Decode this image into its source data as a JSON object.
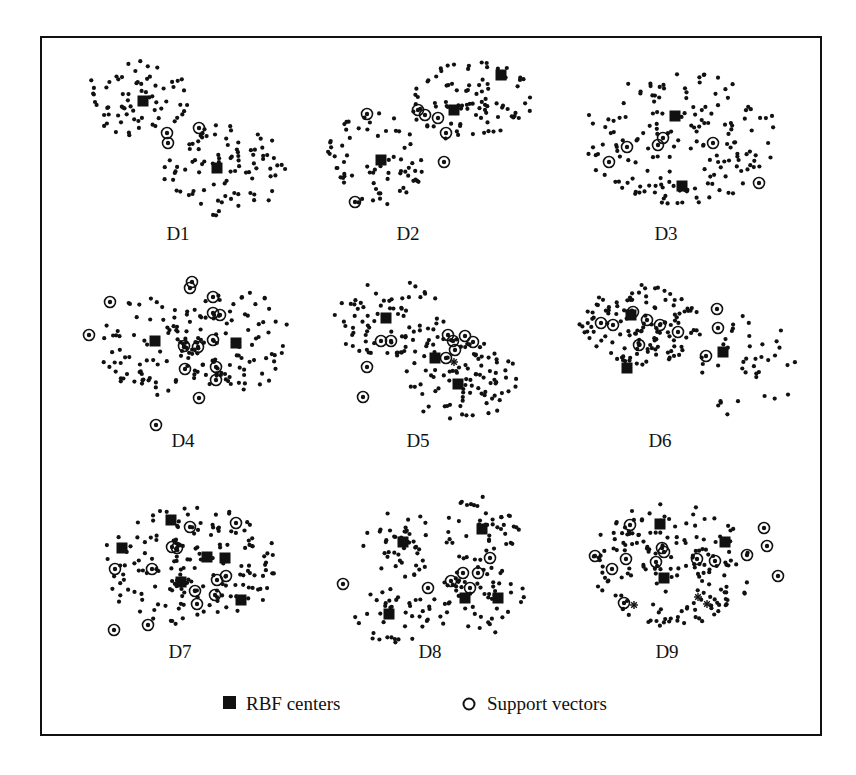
{
  "figure": {
    "frame": {
      "x": 41,
      "y": 37,
      "width": 780,
      "height": 698,
      "stroke": "#111111"
    },
    "legend": {
      "items": [
        {
          "symbol": "filled-square",
          "label": "RBF centers",
          "x": 223,
          "y": 705
        },
        {
          "symbol": "open-circle",
          "label": "Support vectors",
          "x": 462,
          "y": 705
        }
      ]
    }
  },
  "chart_data": [
    {
      "type": "scatter",
      "title": "D1",
      "label_pos": [
        178,
        240
      ],
      "clusters": [
        {
          "cx": 140,
          "cy": 98,
          "rx": 58,
          "ry": 38,
          "n": 70
        },
        {
          "cx": 225,
          "cy": 170,
          "rx": 62,
          "ry": 46,
          "n": 90
        }
      ],
      "rbf_centers": [
        [
          143,
          101
        ],
        [
          217,
          168
        ]
      ],
      "support_vectors": [
        [
          199,
          128
        ],
        [
          167,
          133
        ],
        [
          168,
          143
        ]
      ],
      "stars": [],
      "seed": 11
    },
    {
      "type": "scatter",
      "title": "D2",
      "label_pos": [
        408,
        240
      ],
      "clusters": [
        {
          "cx": 375,
          "cy": 160,
          "rx": 50,
          "ry": 48,
          "n": 70
        },
        {
          "cx": 470,
          "cy": 100,
          "rx": 62,
          "ry": 42,
          "n": 90
        }
      ],
      "rbf_centers": [
        [
          381,
          160
        ],
        [
          454,
          110
        ],
        [
          501,
          75
        ]
      ],
      "support_vectors": [
        [
          367,
          114
        ],
        [
          418,
          110
        ],
        [
          425,
          115
        ],
        [
          438,
          118
        ],
        [
          446,
          133
        ],
        [
          444,
          162
        ],
        [
          355,
          202
        ]
      ],
      "stars": [],
      "seed": 23
    },
    {
      "type": "scatter",
      "title": "D3",
      "label_pos": [
        666,
        240
      ],
      "clusters": [
        {
          "cx": 680,
          "cy": 138,
          "rx": 98,
          "ry": 66,
          "n": 170
        }
      ],
      "rbf_centers": [
        [
          675,
          116
        ],
        [
          682,
          186
        ]
      ],
      "support_vectors": [
        [
          627,
          147
        ],
        [
          609,
          162
        ],
        [
          658,
          145
        ],
        [
          663,
          138
        ],
        [
          713,
          143
        ],
        [
          759,
          183
        ]
      ],
      "stars": [],
      "seed": 37
    },
    {
      "type": "scatter",
      "title": "D4",
      "label_pos": [
        183,
        447
      ],
      "clusters": [
        {
          "cx": 158,
          "cy": 345,
          "rx": 58,
          "ry": 50,
          "n": 90
        },
        {
          "cx": 235,
          "cy": 340,
          "rx": 55,
          "ry": 52,
          "n": 80
        }
      ],
      "rbf_centers": [
        [
          155,
          341
        ],
        [
          236,
          343
        ]
      ],
      "support_vectors": [
        [
          89,
          335
        ],
        [
          110,
          302
        ],
        [
          192,
          282
        ],
        [
          190,
          288
        ],
        [
          213,
          297
        ],
        [
          213,
          313
        ],
        [
          220,
          315
        ],
        [
          213,
          340
        ],
        [
          184,
          346
        ],
        [
          198,
          347
        ],
        [
          185,
          369
        ],
        [
          216,
          367
        ],
        [
          216,
          380
        ],
        [
          199,
          398
        ],
        [
          156,
          425
        ]
      ],
      "stars": [],
      "seed": 41
    },
    {
      "type": "scatter",
      "title": "D5",
      "label_pos": [
        418,
        447
      ],
      "clusters": [
        {
          "cx": 392,
          "cy": 320,
          "rx": 60,
          "ry": 40,
          "n": 80
        },
        {
          "cx": 460,
          "cy": 380,
          "rx": 58,
          "ry": 42,
          "n": 90
        }
      ],
      "rbf_centers": [
        [
          386,
          318
        ],
        [
          435,
          358
        ],
        [
          458,
          384
        ]
      ],
      "support_vectors": [
        [
          381,
          341
        ],
        [
          391,
          341
        ],
        [
          448,
          335
        ],
        [
          453,
          341
        ],
        [
          455,
          350
        ],
        [
          465,
          336
        ],
        [
          473,
          342
        ],
        [
          446,
          358
        ],
        [
          367,
          367
        ],
        [
          363,
          397
        ]
      ],
      "stars": [
        [
          454,
          362
        ]
      ],
      "seed": 53
    },
    {
      "type": "scatter",
      "title": "D6",
      "label_pos": [
        660,
        447
      ],
      "clusters": [
        {
          "cx": 640,
          "cy": 325,
          "rx": 62,
          "ry": 40,
          "n": 130
        },
        {
          "cx": 748,
          "cy": 365,
          "rx": 50,
          "ry": 55,
          "n": 40
        }
      ],
      "rbf_centers": [
        [
          631,
          315
        ],
        [
          627,
          368
        ],
        [
          723,
          352
        ]
      ],
      "support_vectors": [
        [
          601,
          323
        ],
        [
          613,
          325
        ],
        [
          633,
          312
        ],
        [
          647,
          320
        ],
        [
          660,
          325
        ],
        [
          678,
          332
        ],
        [
          639,
          345
        ],
        [
          717,
          309
        ],
        [
          718,
          328
        ],
        [
          706,
          356
        ]
      ],
      "stars": [],
      "seed": 67
    },
    {
      "type": "scatter",
      "title": "D7",
      "label_pos": [
        180,
        658
      ],
      "clusters": [
        {
          "cx": 190,
          "cy": 565,
          "rx": 90,
          "ry": 60,
          "n": 170
        }
      ],
      "rbf_centers": [
        [
          171,
          520
        ],
        [
          122,
          548
        ],
        [
          207,
          557
        ],
        [
          225,
          558
        ],
        [
          181,
          582
        ],
        [
          241,
          600
        ]
      ],
      "support_vectors": [
        [
          236,
          523
        ],
        [
          190,
          527
        ],
        [
          172,
          547
        ],
        [
          177,
          548
        ],
        [
          152,
          569
        ],
        [
          115,
          569
        ],
        [
          217,
          580
        ],
        [
          226,
          576
        ],
        [
          195,
          591
        ],
        [
          215,
          595
        ],
        [
          197,
          604
        ],
        [
          148,
          625
        ],
        [
          114,
          630
        ]
      ],
      "stars": [],
      "seed": 79
    },
    {
      "type": "scatter",
      "title": "D8",
      "label_pos": [
        430,
        658
      ],
      "clusters": [
        {
          "cx": 400,
          "cy": 545,
          "rx": 40,
          "ry": 35,
          "n": 45
        },
        {
          "cx": 482,
          "cy": 530,
          "rx": 38,
          "ry": 35,
          "n": 45
        },
        {
          "cx": 393,
          "cy": 615,
          "rx": 38,
          "ry": 28,
          "n": 40
        },
        {
          "cx": 478,
          "cy": 600,
          "rx": 48,
          "ry": 35,
          "n": 55
        }
      ],
      "rbf_centers": [
        [
          403,
          542
        ],
        [
          482,
          529
        ],
        [
          389,
          614
        ],
        [
          465,
          598
        ],
        [
          498,
          598
        ]
      ],
      "support_vectors": [
        [
          343,
          584
        ],
        [
          428,
          588
        ],
        [
          451,
          581
        ],
        [
          463,
          573
        ],
        [
          478,
          573
        ],
        [
          470,
          588
        ],
        [
          490,
          558
        ]
      ],
      "stars": [],
      "seed": 97
    },
    {
      "type": "scatter",
      "title": "D9",
      "label_pos": [
        667,
        658
      ],
      "clusters": [
        {
          "cx": 672,
          "cy": 565,
          "rx": 82,
          "ry": 62,
          "n": 170
        }
      ],
      "rbf_centers": [
        [
          660,
          524
        ],
        [
          725,
          542
        ],
        [
          664,
          578
        ]
      ],
      "support_vectors": [
        [
          630,
          525
        ],
        [
          595,
          556
        ],
        [
          612,
          569
        ],
        [
          626,
          559
        ],
        [
          662,
          548
        ],
        [
          664,
          552
        ],
        [
          656,
          562
        ],
        [
          697,
          559
        ],
        [
          715,
          561
        ],
        [
          747,
          555
        ],
        [
          764,
          528
        ],
        [
          767,
          546
        ],
        [
          778,
          576
        ],
        [
          624,
          603
        ]
      ],
      "stars": [
        [
          634,
          605
        ],
        [
          707,
          604
        ],
        [
          698,
          597
        ]
      ],
      "seed": 113
    }
  ]
}
